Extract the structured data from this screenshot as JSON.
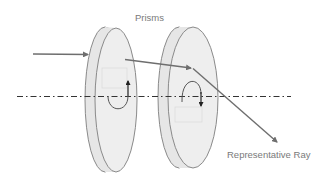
{
  "diagram": {
    "title_label": "Prisms",
    "ray_label": "Representative Ray",
    "elements": {
      "prisms": [
        {
          "name": "Prism 1",
          "rotation_arrow": "up"
        },
        {
          "name": "Prism 2",
          "rotation_arrow": "down"
        }
      ],
      "optical_axis": "dash-dot line",
      "incoming_ray": "arrow",
      "outgoing_ray": "Representative Ray"
    },
    "colors": {
      "prism_fill": "#ececec",
      "prism_stroke": "#8a8a8a",
      "ray": "#6e6e6e",
      "axis": "#333333",
      "text": "#7a7a7a",
      "rotation_arrow": "#222222"
    }
  }
}
